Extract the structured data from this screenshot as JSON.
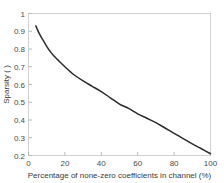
{
  "chart_data": {
    "type": "line",
    "title": "",
    "xlabel": "Percentage of none-zero coefficients in channel (%)",
    "ylabel": "Sparsity ( )",
    "xlim": [
      0,
      100
    ],
    "ylim": [
      0.2,
      1
    ],
    "xticks": [
      "0",
      "20",
      "40",
      "60",
      "80",
      "100"
    ],
    "xtick_values": [
      0,
      20,
      40,
      60,
      80,
      100
    ],
    "yticks": [
      "0.2",
      "0.3",
      "0.4",
      "0.5",
      "0.6",
      "0.7",
      "0.8",
      "0.9",
      "1"
    ],
    "ytick_values": [
      0.2,
      0.3,
      0.4,
      0.5,
      0.6,
      0.7,
      0.8,
      0.9,
      1
    ],
    "grid": false,
    "legend": null,
    "series": [
      {
        "name": "sparsity-curve",
        "color": "#2b2b2b",
        "x": [
          4,
          6,
          8,
          10,
          12,
          14,
          16,
          18,
          20,
          25,
          30,
          35,
          40,
          45,
          50,
          55,
          60,
          65,
          70,
          75,
          80,
          85,
          90,
          95,
          100
        ],
        "y": [
          0.93,
          0.885,
          0.85,
          0.815,
          0.785,
          0.76,
          0.74,
          0.72,
          0.7,
          0.655,
          0.62,
          0.59,
          0.56,
          0.525,
          0.49,
          0.465,
          0.435,
          0.41,
          0.385,
          0.355,
          0.325,
          0.295,
          0.265,
          0.238,
          0.21
        ]
      }
    ]
  },
  "axes": {
    "x_title": "Percentage of none-zero coefficients in channel (%)",
    "y_title": "Sparsity ( )"
  }
}
